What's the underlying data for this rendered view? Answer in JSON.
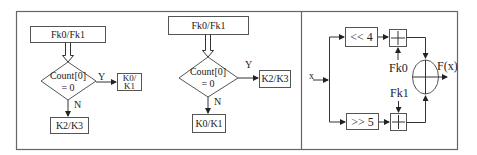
{
  "panel_a": {
    "top_box": "Fk0/Fk1",
    "decision_line1": "Count[0]",
    "decision_line2": "= 0",
    "yes_label": "Y",
    "no_label": "N",
    "yes_box_line1": "K0/",
    "yes_box_line2": "K1",
    "no_box": "K2/K3"
  },
  "panel_b": {
    "top_box": "Fk0/Fk1",
    "decision_line1": "Count[0]",
    "decision_line2": "= 0",
    "yes_label": "Y",
    "no_label": "N",
    "yes_box": "K2/K3",
    "no_box": "K0/K1"
  },
  "panel_c": {
    "input_label": "x",
    "shift_left": "<< 4",
    "shift_right": ">> 5",
    "key0": "Fk0",
    "key1": "Fk1",
    "output_label": "F(x)"
  }
}
